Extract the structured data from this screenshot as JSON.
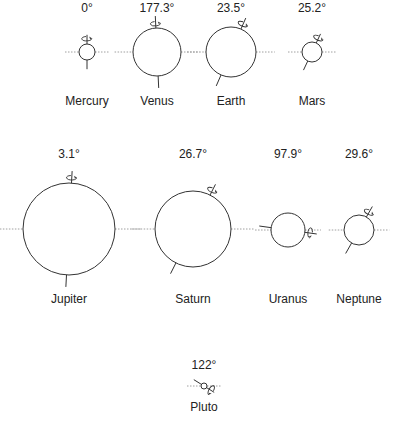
{
  "planets": [
    {
      "name": "Mercury",
      "tilt_label": "0°",
      "tilt": 0,
      "spin": "top"
    },
    {
      "name": "Venus",
      "tilt_label": "177.3°",
      "tilt": 177.3,
      "spin": "bottom"
    },
    {
      "name": "Earth",
      "tilt_label": "23.5°",
      "tilt": 23.5,
      "spin": "top"
    },
    {
      "name": "Mars",
      "tilt_label": "25.2°",
      "tilt": 25.2,
      "spin": "top"
    },
    {
      "name": "Jupiter",
      "tilt_label": "3.1°",
      "tilt": 3.1,
      "spin": "top"
    },
    {
      "name": "Saturn",
      "tilt_label": "26.7°",
      "tilt": 26.7,
      "spin": "top"
    },
    {
      "name": "Uranus",
      "tilt_label": "97.9°",
      "tilt": 97.9,
      "spin": "left"
    },
    {
      "name": "Neptune",
      "tilt_label": "29.6°",
      "tilt": 29.6,
      "spin": "top"
    },
    {
      "name": "Pluto",
      "tilt_label": "122°",
      "tilt": 122,
      "spin": "left"
    }
  ]
}
